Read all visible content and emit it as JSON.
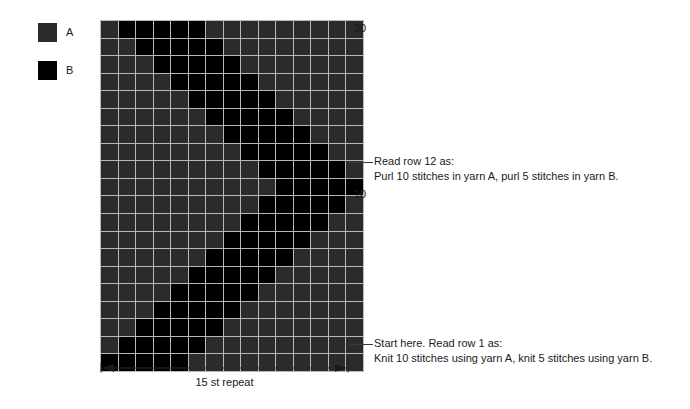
{
  "legend": {
    "items": [
      {
        "label": "A",
        "color": "#2b2b2b",
        "name": "yarn-a"
      },
      {
        "label": "B",
        "color": "#000000",
        "name": "yarn-b"
      }
    ]
  },
  "grid": {
    "columns": 15,
    "rows": 20,
    "cell_width": 16.5,
    "cell_height": 16.55,
    "gridline_color": "#b9b9b9",
    "colors": {
      "A": "#2b2b2b",
      "B": "#000000"
    }
  },
  "row_labels": [
    {
      "text": "20",
      "row": 20
    },
    {
      "text": "10",
      "row": 10
    }
  ],
  "annotations": [
    {
      "name": "row-12-annotation",
      "row": 12,
      "lines": [
        "Read row 12 as:",
        "Purl 10 stitches in yarn A, purl 5 stitches in yarn B."
      ]
    },
    {
      "name": "row-1-annotation",
      "row": 1,
      "lines": [
        "Start here. Read row 1 as:",
        "Knit 10 stitches using yarn A, knit 5 stitches using yarn B."
      ]
    }
  ],
  "repeat": {
    "caption": "15 st repeat",
    "stitches": 15
  },
  "chart_data": {
    "type": "heatmap",
    "title": "",
    "xlabel": "15 st repeat",
    "ylabel": "",
    "grid": true,
    "legend_position": "top-left",
    "categories_x": [
      1,
      2,
      3,
      4,
      5,
      6,
      7,
      8,
      9,
      10,
      11,
      12,
      13,
      14,
      15
    ],
    "categories_y": [
      1,
      2,
      3,
      4,
      5,
      6,
      7,
      8,
      9,
      10,
      11,
      12,
      13,
      14,
      15,
      16,
      17,
      18,
      19,
      20
    ],
    "value_legend": {
      "A": "yarn A (dark gray)",
      "B": "yarn B (black)"
    },
    "note": "rows listed top (row 20) to bottom (row 1); each string is 15 characters, column 1 at left",
    "rows": [
      {
        "row": 20,
        "cells": "ABBBBBAAAAAAAAA"
      },
      {
        "row": 19,
        "cells": "AABBBBBAAAAAAAA"
      },
      {
        "row": 18,
        "cells": "AAABBBBBAAAAAAA"
      },
      {
        "row": 17,
        "cells": "AAAABBBBBAAAAAA"
      },
      {
        "row": 16,
        "cells": "AAAAABBBBBAAAAA"
      },
      {
        "row": 15,
        "cells": "AAAAAABBBBBAAAA"
      },
      {
        "row": 14,
        "cells": "AAAAAAABBBBBAAA"
      },
      {
        "row": 13,
        "cells": "AAAAAAAABBBBBAA"
      },
      {
        "row": 12,
        "cells": "AAAAAAAAABBBBBA"
      },
      {
        "row": 11,
        "cells": "AAAAAAAAAABBBBB"
      },
      {
        "row": 10,
        "cells": "AAAAAAAAABBBBBA"
      },
      {
        "row": 9,
        "cells": "AAAAAAAABBBBBAA"
      },
      {
        "row": 8,
        "cells": "AAAAAAABBBBBAAA"
      },
      {
        "row": 7,
        "cells": "AAAAAABBBBBAAAA"
      },
      {
        "row": 6,
        "cells": "AAAAABBBBBAAAAA"
      },
      {
        "row": 5,
        "cells": "AAAABBBBBAAAAAA"
      },
      {
        "row": 4,
        "cells": "AAABBBBBAAAAAAA"
      },
      {
        "row": 3,
        "cells": "AABBBBBAAAAAAAA"
      },
      {
        "row": 2,
        "cells": "ABBBBBAAAAAAAAA"
      },
      {
        "row": 1,
        "cells": "BBBBBAAAAAAAAAA"
      }
    ]
  }
}
